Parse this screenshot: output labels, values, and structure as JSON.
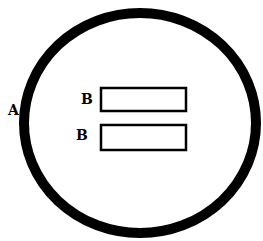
{
  "diagram": {
    "colors": {
      "stroke": "#000000",
      "background": "#ffffff"
    },
    "circle": {
      "label": "A",
      "cx": 140,
      "cy": 123,
      "rx": 116,
      "ry": 110,
      "stroke_width": 10
    },
    "rectangles": [
      {
        "label": "B",
        "x": 101,
        "y": 88,
        "width": 85,
        "height": 23
      },
      {
        "label": "B",
        "x": 101,
        "y": 125,
        "width": 85,
        "height": 25
      }
    ]
  }
}
